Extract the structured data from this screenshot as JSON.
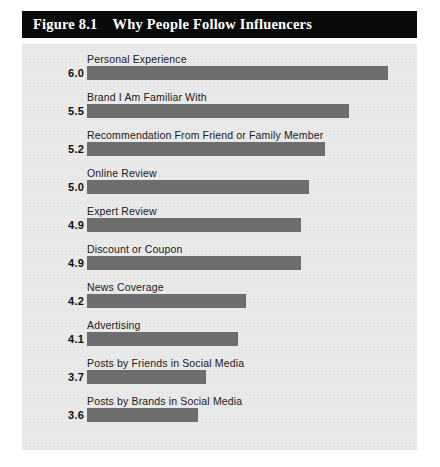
{
  "figure": {
    "number": "Figure 8.1",
    "title": "Why People Follow Influencers"
  },
  "colors": {
    "banner_background": "#0a0a0a",
    "banner_text": "#ffffff",
    "panel_background": "#eaeaea",
    "bar": "#6e6e6e",
    "label_text": "#202020",
    "value_text": "#101010"
  },
  "chart_data": {
    "type": "bar",
    "orientation": "horizontal",
    "title": "Why People Follow Influencers",
    "xlabel": "",
    "ylabel": "",
    "grid": false,
    "legend": null,
    "axis_origin_value": 2.2,
    "xlim": [
      2.2,
      6.2
    ],
    "value_format": "one-decimal",
    "categories": [
      "Personal Experience",
      "Brand I Am Familiar With",
      "Recommendation From Friend or Family Member",
      "Online Review",
      "Expert Review",
      "Discount or Coupon",
      "News Coverage",
      "Advertising",
      "Posts by Friends in Social Media",
      "Posts by Brands in Social Media"
    ],
    "values": [
      6.0,
      5.5,
      5.2,
      5.0,
      4.9,
      4.9,
      4.2,
      4.1,
      3.7,
      3.6
    ],
    "value_labels": [
      "6.0",
      "5.5",
      "5.2",
      "5.0",
      "4.9",
      "4.9",
      "4.2",
      "4.1",
      "3.7",
      "3.6"
    ]
  }
}
